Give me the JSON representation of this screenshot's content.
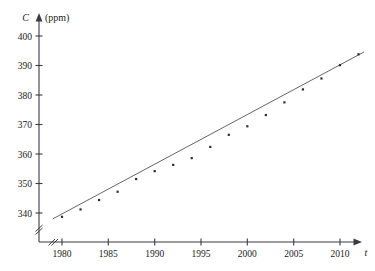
{
  "chart_data": {
    "type": "scatter",
    "title": "",
    "subtitle": "",
    "xlabel": "t",
    "ylabel": "C",
    "yunit": "(ppm)",
    "xlim": [
      1978.2,
      2013.5
    ],
    "ylim": [
      336.5,
      402.0
    ],
    "x_ticks": [
      1980,
      1985,
      1990,
      1995,
      2000,
      2005,
      2010
    ],
    "x_tick_labels": [
      "1980",
      "1985",
      "1990",
      "1995",
      "2000",
      "2005",
      "2010"
    ],
    "y_ticks": [
      340,
      350,
      360,
      370,
      380,
      390,
      400
    ],
    "y_tick_labels": [
      "340",
      "350",
      "360",
      "370",
      "380",
      "390",
      "400"
    ],
    "grid": false,
    "legend": "none",
    "axis_break_x": true,
    "axis_break_y": true,
    "x": [
      1980,
      1982,
      1984,
      1986,
      1988,
      1990,
      1992,
      1994,
      1996,
      1998,
      2000,
      2002,
      2004,
      2006,
      2008,
      2010,
      2012
    ],
    "values": [
      338.7,
      341.2,
      344.4,
      347.2,
      351.5,
      354.2,
      356.3,
      358.6,
      362.4,
      366.5,
      369.4,
      373.2,
      377.5,
      381.9,
      385.6,
      390.1,
      393.8
    ],
    "series": [
      {
        "name": "CO2 concentration",
        "marker": "dot",
        "values": [
          338.7,
          341.2,
          344.4,
          347.2,
          351.5,
          354.2,
          356.3,
          358.6,
          362.4,
          366.5,
          369.4,
          373.2,
          377.5,
          381.9,
          385.6,
          390.1,
          393.8
        ]
      }
    ],
    "fit_line": {
      "name": "regression line",
      "x_start": 1979.0,
      "y_start": 338.0,
      "x_end": 2012.6,
      "y_end": 394.6
    }
  },
  "axes": {
    "y_axis_name": "C",
    "y_axis_unit": "(ppm)",
    "x_axis_name": "t"
  }
}
